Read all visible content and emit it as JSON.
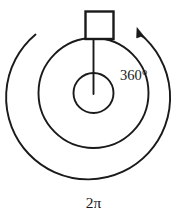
{
  "figure": {
    "background_color": "#ffffff",
    "stroke_color": "#1a1a1a",
    "width": 186,
    "height": 217
  },
  "labels": {
    "degrees": "360°",
    "radians": "2π"
  },
  "geometry": {
    "center_x": 93.5,
    "center_y": 93,
    "inner_circle_radius": 20,
    "middle_circle_radius": 55,
    "outer_arc_radius": 82,
    "square_size": 28,
    "radius_line_angle": "90",
    "rotation_direction": "counterclockwise"
  },
  "parts": {
    "inner_circle_name": "inner circle",
    "middle_circle_name": "middle circle",
    "outer_arc_name": "outer rotation arc",
    "square_name": "rotating block",
    "radius_line_name": "radius line",
    "arrowhead_name": "direction arrowhead"
  }
}
